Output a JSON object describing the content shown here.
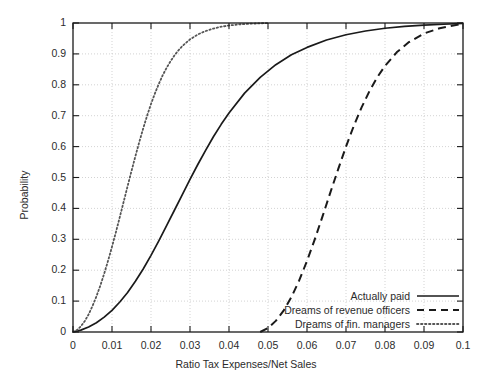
{
  "chart_data": {
    "type": "line",
    "title": "",
    "xlabel": "Ratio Tax Expenses/Net Sales",
    "ylabel": "Probability",
    "xlim": [
      0,
      0.1
    ],
    "ylim": [
      0,
      1
    ],
    "grid": true,
    "legend_position": "bottom-right",
    "xticks": [
      0,
      0.01,
      0.02,
      0.03,
      0.04,
      0.05,
      0.06,
      0.07,
      0.08,
      0.09,
      0.1
    ],
    "xticklabels": [
      "0",
      "0.01",
      "0.02",
      "0.03",
      "0.04",
      "0.05",
      "0.06",
      "0.07",
      "0.08",
      "0.09",
      "0.1"
    ],
    "yticks": [
      0,
      0.1,
      0.2,
      0.3,
      0.4,
      0.5,
      0.6,
      0.7,
      0.8,
      0.9,
      1
    ],
    "yticklabels": [
      "0",
      "0.1",
      "0.2",
      "0.3",
      "0.4",
      "0.5",
      "0.6",
      "0.7",
      "0.8",
      "0.9",
      "1"
    ],
    "series": [
      {
        "name": "Actually paid",
        "style": "solid",
        "color": "#1a1a1a",
        "x": [
          0,
          0.002,
          0.004,
          0.006,
          0.008,
          0.01,
          0.012,
          0.014,
          0.016,
          0.018,
          0.02,
          0.022,
          0.024,
          0.026,
          0.028,
          0.03,
          0.032,
          0.034,
          0.036,
          0.038,
          0.04,
          0.044,
          0.048,
          0.052,
          0.056,
          0.06,
          0.065,
          0.07,
          0.075,
          0.08,
          0.085,
          0.09,
          0.095,
          0.1
        ],
        "y": [
          0.0,
          0.006,
          0.016,
          0.03,
          0.048,
          0.07,
          0.097,
          0.128,
          0.164,
          0.204,
          0.248,
          0.295,
          0.344,
          0.394,
          0.444,
          0.494,
          0.542,
          0.588,
          0.632,
          0.672,
          0.709,
          0.773,
          0.824,
          0.865,
          0.897,
          0.921,
          0.945,
          0.962,
          0.974,
          0.983,
          0.989,
          0.993,
          0.996,
          0.999
        ]
      },
      {
        "name": "Dreams of revenue officers",
        "style": "dashed",
        "color": "#1a1a1a",
        "x": [
          0.048,
          0.05,
          0.052,
          0.054,
          0.056,
          0.058,
          0.06,
          0.062,
          0.064,
          0.066,
          0.068,
          0.07,
          0.072,
          0.074,
          0.076,
          0.078,
          0.08,
          0.083,
          0.086,
          0.09,
          0.094,
          0.1
        ],
        "y": [
          0.0,
          0.013,
          0.036,
          0.069,
          0.113,
          0.167,
          0.23,
          0.3,
          0.375,
          0.452,
          0.527,
          0.6,
          0.667,
          0.727,
          0.779,
          0.824,
          0.861,
          0.905,
          0.937,
          0.966,
          0.983,
          0.998
        ]
      },
      {
        "name": "Dreams of fin. managers",
        "style": "dotted",
        "color": "#555555",
        "x": [
          0,
          0.001,
          0.002,
          0.003,
          0.004,
          0.005,
          0.006,
          0.007,
          0.008,
          0.009,
          0.01,
          0.011,
          0.012,
          0.013,
          0.014,
          0.015,
          0.016,
          0.017,
          0.018,
          0.019,
          0.02,
          0.021,
          0.022,
          0.023,
          0.024,
          0.025,
          0.026,
          0.027,
          0.028,
          0.03,
          0.032,
          0.034,
          0.036,
          0.038,
          0.04,
          0.043,
          0.046,
          0.05
        ],
        "y": [
          0.0,
          0.006,
          0.018,
          0.035,
          0.057,
          0.084,
          0.115,
          0.15,
          0.189,
          0.231,
          0.276,
          0.323,
          0.372,
          0.422,
          0.472,
          0.521,
          0.569,
          0.615,
          0.659,
          0.7,
          0.738,
          0.772,
          0.803,
          0.831,
          0.855,
          0.876,
          0.895,
          0.911,
          0.925,
          0.947,
          0.963,
          0.974,
          0.982,
          0.988,
          0.992,
          0.996,
          0.998,
          1.0
        ]
      }
    ]
  },
  "legend": {
    "entries": [
      {
        "label": "Actually paid",
        "key": "solid-line-key"
      },
      {
        "label": "Dreams of revenue officers",
        "key": "dashed-line-key"
      },
      {
        "label": "Dreams of fin. managers",
        "key": "dotted-line-key"
      }
    ]
  },
  "colors": {
    "background": "#ffffff",
    "axis": "#1a1a1a",
    "grid": "#c8c8c8",
    "text": "#2b2b2b"
  }
}
